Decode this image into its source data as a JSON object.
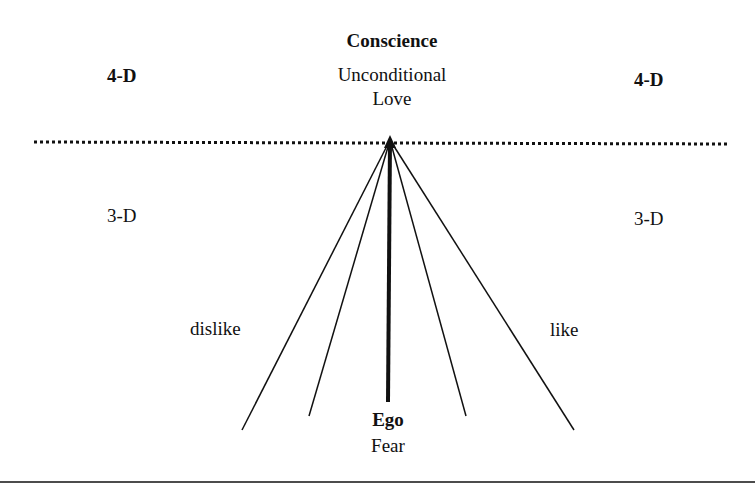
{
  "top": {
    "title": "Conscience",
    "subtitle_line1": "Unconditional",
    "subtitle_line2": "Love"
  },
  "left": {
    "upper": "4-D",
    "lower": "3-D",
    "side": "dislike"
  },
  "right": {
    "upper": "4-D",
    "lower": "3-D",
    "side": "like"
  },
  "bottom": {
    "title": "Ego",
    "subtitle": "Fear"
  },
  "lines": {
    "boundary": "dotted",
    "fan_count": 5,
    "center_emphasized": true
  }
}
